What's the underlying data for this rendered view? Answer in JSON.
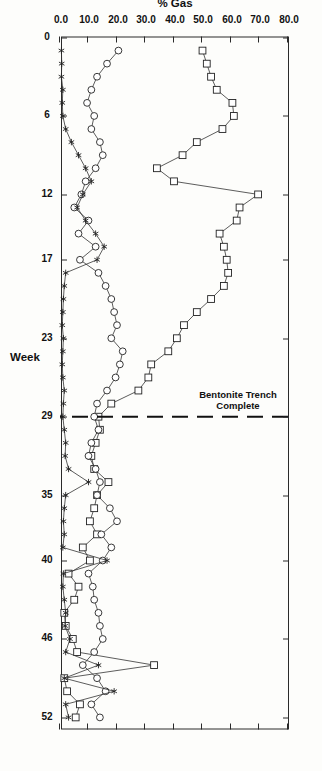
{
  "chart_data": {
    "type": "line",
    "title": "Off - Site  Gas  Recorded  1990",
    "xlabel": "Week",
    "ylabel": "% Gas",
    "orientation": "page-rotated-90",
    "grid": false,
    "legend_position": "none",
    "xlim": [
      0,
      53
    ],
    "ylim": [
      0,
      80
    ],
    "xticks": [
      0,
      6,
      12,
      17,
      23,
      29,
      35,
      40,
      46,
      52
    ],
    "xticklabels": [
      "0",
      "6",
      "12",
      "17",
      "23",
      "29",
      "35",
      "40",
      "46",
      "52"
    ],
    "yticks": [
      0,
      10,
      20,
      30,
      40,
      50,
      60,
      70,
      80
    ],
    "yticklabels": [
      "0.0",
      "10.0",
      "20.0",
      "30.0",
      "40.0",
      "50.0",
      "60.0",
      "70.0",
      "80.0"
    ],
    "annotations": [
      {
        "text_line1": "Bentonite Trench",
        "text_line2": "Complete",
        "marker": "vertical dashed line",
        "x": 29
      }
    ],
    "series": [
      {
        "name": "Borehole A",
        "marker": "square",
        "x": [
          1,
          2,
          3,
          4,
          5,
          6,
          7,
          8,
          9,
          10,
          11,
          12,
          13,
          14,
          15,
          16,
          17,
          18,
          19,
          20,
          21,
          22,
          23,
          24,
          25,
          26,
          27,
          28,
          29,
          30,
          31,
          32,
          33,
          34,
          35,
          36,
          37,
          38,
          39,
          40,
          41,
          42,
          43,
          44,
          45,
          46,
          47,
          48,
          49,
          50,
          51,
          52
        ],
        "values": [
          50.0,
          51.5,
          53.0,
          55.0,
          60.5,
          61.0,
          57.0,
          48.0,
          43.0,
          34.0,
          40.0,
          69.5,
          63.0,
          62.0,
          56.0,
          57.5,
          58.5,
          59.0,
          57.5,
          53.0,
          48.0,
          43.5,
          41.0,
          38.0,
          32.0,
          31.0,
          27.5,
          18.0,
          13.5,
          14.0,
          12.5,
          11.0,
          12.0,
          17.0,
          13.0,
          12.0,
          10.5,
          13.0,
          8.0,
          10.5,
          3.0,
          6.5,
          5.0,
          1.5,
          2.0,
          4.5,
          6.0,
          33.0,
          1.5,
          2.5,
          7.0,
          5.5
        ]
      },
      {
        "name": "Borehole B",
        "marker": "circle",
        "x": [
          1,
          2,
          3,
          4,
          5,
          6,
          7,
          8,
          9,
          10,
          11,
          12,
          13,
          14,
          15,
          16,
          17,
          18,
          19,
          20,
          21,
          22,
          23,
          24,
          25,
          26,
          27,
          28,
          29,
          30,
          31,
          32,
          33,
          34,
          35,
          36,
          37,
          38,
          39,
          40,
          41,
          42,
          43,
          44,
          45,
          46,
          47,
          48,
          49,
          50,
          51,
          52
        ],
        "values": [
          20.5,
          16.5,
          13.0,
          11.0,
          9.5,
          12.0,
          11.0,
          14.0,
          15.0,
          12.5,
          9.0,
          7.5,
          5.0,
          10.0,
          6.5,
          12.5,
          7.0,
          13.5,
          16.0,
          18.0,
          19.0,
          20.0,
          18.0,
          22.0,
          21.0,
          19.5,
          16.5,
          13.0,
          12.0,
          13.5,
          11.0,
          10.0,
          12.5,
          14.0,
          13.0,
          17.5,
          20.0,
          14.5,
          18.0,
          15.0,
          10.0,
          11.5,
          12.0,
          13.5,
          14.0,
          15.0,
          12.0,
          8.0,
          13.0,
          16.0,
          11.0,
          14.0
        ]
      },
      {
        "name": "Borehole C",
        "marker": "asterisk",
        "x": [
          1,
          2,
          3,
          4,
          5,
          6,
          7,
          8,
          9,
          10,
          11,
          12,
          13,
          14,
          15,
          16,
          17,
          18,
          19,
          20,
          21,
          22,
          23,
          24,
          25,
          26,
          27,
          28,
          29,
          30,
          31,
          32,
          33,
          34,
          35,
          36,
          37,
          38,
          39,
          40,
          41,
          42,
          43,
          44,
          45,
          46,
          47,
          48,
          49,
          50,
          51,
          52
        ],
        "values": [
          0.5,
          0.6,
          0.5,
          1.0,
          0.8,
          1.0,
          2.0,
          4.0,
          6.5,
          9.0,
          11.0,
          8.0,
          6.0,
          9.0,
          12.5,
          15.5,
          13.0,
          2.0,
          1.5,
          1.2,
          1.0,
          0.8,
          1.2,
          1.0,
          0.8,
          1.0,
          1.5,
          1.2,
          1.0,
          1.5,
          2.0,
          1.8,
          3.0,
          10.0,
          2.0,
          1.5,
          1.2,
          1.5,
          1.0,
          16.5,
          1.2,
          1.0,
          1.5,
          2.0,
          1.8,
          3.5,
          2.0,
          13.5,
          1.5,
          19.0,
          2.0,
          3.0
        ]
      }
    ]
  }
}
